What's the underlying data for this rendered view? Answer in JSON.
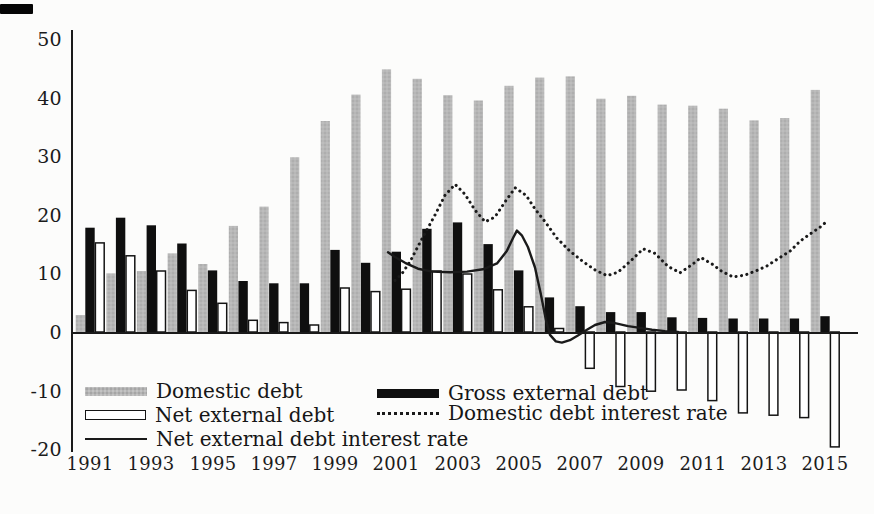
{
  "chart_data": {
    "type": "combo-bar-line",
    "title": "",
    "xlabel": "",
    "ylabel": "",
    "ylim": [
      -20,
      50
    ],
    "grid": false,
    "x_years": [
      1991,
      1992,
      1993,
      1994,
      1995,
      1996,
      1997,
      1998,
      1999,
      2000,
      2001,
      2002,
      2003,
      2004,
      2005,
      2006,
      2007,
      2008,
      2009,
      2010,
      2011,
      2012,
      2013,
      2014,
      2015
    ],
    "x_tick_labels": [
      "1991",
      "1993",
      "1995",
      "1997",
      "1999",
      "2001",
      "2003",
      "2005",
      "2007",
      "2009",
      "2011",
      "2013",
      "2015"
    ],
    "x_tick_years": [
      1991,
      1993,
      1995,
      1997,
      1999,
      2001,
      2003,
      2005,
      2007,
      2009,
      2011,
      2013,
      2015
    ],
    "y_ticks": [
      50,
      40,
      30,
      20,
      10,
      0,
      -10,
      -20
    ],
    "y_tick_labels": [
      "50",
      "40",
      "30",
      "20",
      "10",
      "0",
      "-10",
      "-20"
    ],
    "bar_series": [
      {
        "name": "Domestic debt",
        "style": "gray",
        "values": [
          2.9,
          10.0,
          10.4,
          13.4,
          11.6,
          18.1,
          21.4,
          29.8,
          36.0,
          40.5,
          44.8,
          43.2,
          40.4,
          39.5,
          42.0,
          43.4,
          43.6,
          39.8,
          40.3,
          38.8,
          38.6,
          38.1,
          36.1,
          36.5,
          41.3
        ]
      },
      {
        "name": "Gross external debt",
        "style": "black",
        "values": [
          17.8,
          19.5,
          18.2,
          15.1,
          10.5,
          8.7,
          8.3,
          8.3,
          14.0,
          11.8,
          13.7,
          17.6,
          18.7,
          15.0,
          10.5,
          5.9,
          4.4,
          3.4,
          3.4,
          2.5,
          2.4,
          2.3,
          2.3,
          2.3,
          2.7
        ]
      },
      {
        "name": "Net external debt",
        "style": "white-outline",
        "values": [
          15.2,
          13.0,
          10.4,
          7.1,
          4.9,
          2.0,
          1.6,
          1.2,
          7.5,
          6.9,
          7.3,
          10.4,
          9.9,
          7.2,
          4.3,
          0.6,
          -6.2,
          -9.3,
          -10.1,
          -9.9,
          -11.7,
          -13.8,
          -14.2,
          -14.6,
          -19.6
        ]
      }
    ],
    "line_series": [
      {
        "name": "Domestic debt interest rate",
        "style": "dotted",
        "points": [
          [
            2000.96,
            8.8
          ],
          [
            2001.19,
            10.0
          ],
          [
            2001.45,
            12.0
          ],
          [
            2001.78,
            15.3
          ],
          [
            2002.27,
            20.0
          ],
          [
            2002.59,
            23.3
          ],
          [
            2002.92,
            25.2
          ],
          [
            2003.24,
            23.5
          ],
          [
            2003.57,
            20.8
          ],
          [
            2003.9,
            18.8
          ],
          [
            2004.22,
            19.6
          ],
          [
            2004.55,
            22.2
          ],
          [
            2004.88,
            24.6
          ],
          [
            2005.24,
            23.3
          ],
          [
            2005.53,
            21.0
          ],
          [
            2005.86,
            18.8
          ],
          [
            2006.25,
            16.0
          ],
          [
            2006.67,
            13.8
          ],
          [
            2007.1,
            12.0
          ],
          [
            2007.49,
            10.6
          ],
          [
            2007.88,
            9.6
          ],
          [
            2008.24,
            10.2
          ],
          [
            2008.63,
            12.0
          ],
          [
            2009.06,
            14.2
          ],
          [
            2009.45,
            13.4
          ],
          [
            2009.87,
            11.2
          ],
          [
            2010.27,
            10.1
          ],
          [
            2010.66,
            11.5
          ],
          [
            2010.95,
            12.7
          ],
          [
            2011.31,
            11.6
          ],
          [
            2011.64,
            10.3
          ],
          [
            2012.0,
            9.4
          ],
          [
            2012.39,
            9.7
          ],
          [
            2012.78,
            10.5
          ],
          [
            2013.11,
            11.3
          ],
          [
            2013.47,
            12.5
          ],
          [
            2013.86,
            13.8
          ],
          [
            2014.19,
            15.5
          ],
          [
            2014.51,
            16.7
          ],
          [
            2014.84,
            17.9
          ],
          [
            2015.0,
            18.6
          ]
        ]
      },
      {
        "name": "Net external debt interest rate",
        "style": "solid",
        "points": [
          [
            2000.73,
            13.6
          ],
          [
            2000.96,
            12.8
          ],
          [
            2001.29,
            11.8
          ],
          [
            2001.71,
            10.8
          ],
          [
            2002.17,
            10.3
          ],
          [
            2002.76,
            10.2
          ],
          [
            2003.31,
            10.3
          ],
          [
            2003.83,
            10.7
          ],
          [
            2004.29,
            11.7
          ],
          [
            2004.61,
            13.8
          ],
          [
            2004.81,
            16.0
          ],
          [
            2004.94,
            17.3
          ],
          [
            2005.1,
            16.5
          ],
          [
            2005.3,
            14.5
          ],
          [
            2005.53,
            11.0
          ],
          [
            2005.72,
            6.5
          ],
          [
            2005.89,
            2.0
          ],
          [
            2006.02,
            -0.5
          ],
          [
            2006.21,
            -1.6
          ],
          [
            2006.41,
            -1.8
          ],
          [
            2006.67,
            -1.4
          ],
          [
            2006.93,
            -0.6
          ],
          [
            2007.2,
            0.3
          ],
          [
            2007.49,
            1.2
          ],
          [
            2007.82,
            1.7
          ],
          [
            2008.14,
            1.5
          ],
          [
            2008.57,
            1.0
          ],
          [
            2008.96,
            0.7
          ],
          [
            2009.35,
            0.4
          ],
          [
            2009.78,
            0.15
          ],
          [
            2010.2,
            0.0
          ]
        ]
      }
    ],
    "legend": {
      "position": "bottom-left-inside",
      "entries": [
        {
          "label": "Domestic debt",
          "swatch": "gray-bar"
        },
        {
          "label": "Gross external debt",
          "swatch": "black-bar"
        },
        {
          "label": "Net external debt",
          "swatch": "white-bar"
        },
        {
          "label": "Domestic debt interest rate",
          "swatch": "dotted-line"
        },
        {
          "label": "Net external debt interest rate",
          "swatch": "solid-line"
        }
      ]
    },
    "colors": {
      "gray_bar": "#b5b5b5",
      "black_bar": "#0f0f0f",
      "white_bar_fill": "#ffffff",
      "line": "#1a1a1a",
      "axis": "#1a1a1a",
      "background": "#fcfcfb"
    }
  }
}
